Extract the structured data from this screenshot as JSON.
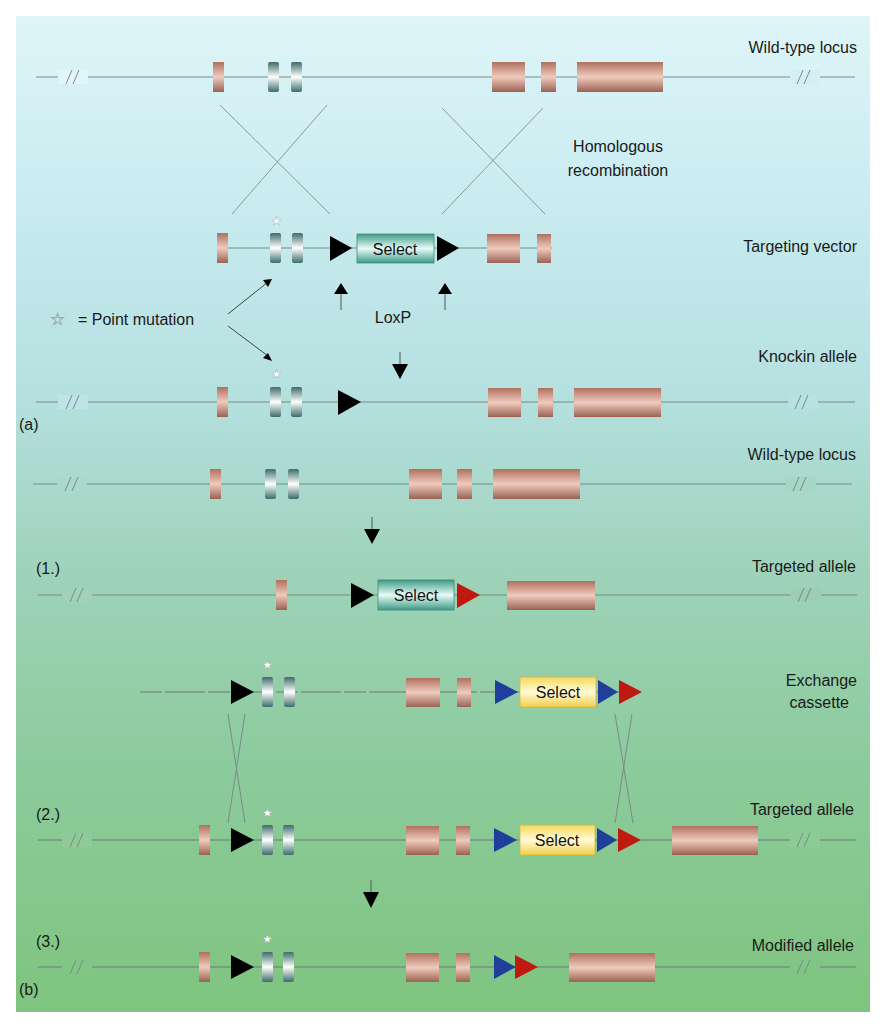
{
  "figure": {
    "panel_labels": {
      "a": "(a)",
      "b": "(b)"
    },
    "step_labels": {
      "s1": "(1.)",
      "s2": "(2.)",
      "s3": "(3.)"
    },
    "row_labels": {
      "wildtype_a": "Wild-type locus",
      "homologous_line1": "Homologous",
      "homologous_line2": "recombination",
      "targeting_vector": "Targeting vector",
      "knockin": "Knockin allele",
      "wildtype_b": "Wild-type locus",
      "targeted_1": "Targeted allele",
      "exchange_line1": "Exchange",
      "exchange_line2": "cassette",
      "targeted_2": "Targeted allele",
      "modified": "Modified allele"
    },
    "legend": {
      "star_symbol": "☆",
      "point_mutation": "= Point mutation"
    },
    "loxp_label": "LoxP",
    "select_label": "Select",
    "colors": {
      "exon": "#c99a86",
      "mutant_exon": "#5f8f8f",
      "select_teal": "#5fb8a8",
      "select_yellow": "#fbe98a",
      "loxp_black": "#000000",
      "lox_blue": "#1f3f9a",
      "lox_red": "#c01a10",
      "line": "#7a8a8a"
    }
  }
}
